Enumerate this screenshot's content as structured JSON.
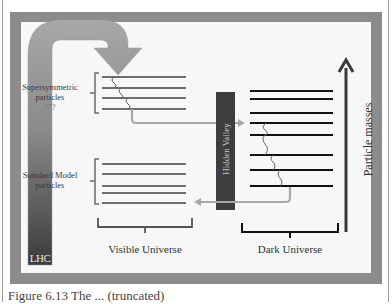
{
  "diagram": {
    "labels": {
      "supersymmetric": "Supersymmetric",
      "supersymmetric_line2": "particles",
      "supersymmetric_line3": "???",
      "standard_model": "Standard Model",
      "standard_model_line2": "particles",
      "lhc": "LHC",
      "hidden_valley": "Hidden Valley",
      "visible_universe": "Visible Universe",
      "dark_universe": "Dark Universe",
      "particle_masses": "Particle masses"
    },
    "colors": {
      "frame": "#8c8c8c",
      "panel": "#f7f7f7",
      "visible_lines": "#6e6e6e",
      "dark_lines": "#111111",
      "hidden_valley_bar": "#3e3e3e",
      "lhc_bar_dark": "#3a3a3a",
      "arrow_gray": "#9a9a9a"
    },
    "supersymmetric_levels": 4,
    "standard_model_levels": 5,
    "dark_levels": 8
  },
  "caption": {
    "text": "Figure 6.13  The ... (truncated)"
  }
}
